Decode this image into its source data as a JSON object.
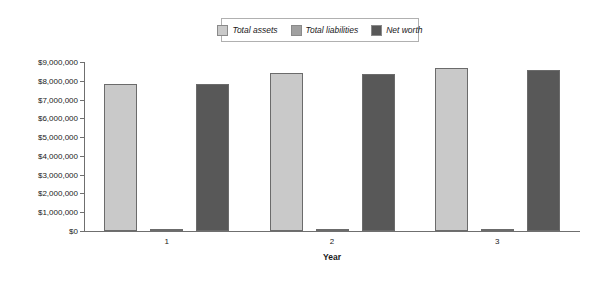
{
  "chart_data": {
    "type": "bar",
    "title": "",
    "subtitle": "",
    "xlabel": "Year",
    "ylabel": "",
    "categories": [
      "1",
      "2",
      "3"
    ],
    "series": [
      {
        "name": "Total assets",
        "color": "#c9c9c9",
        "values": [
          7850000,
          8400000,
          8700000
        ]
      },
      {
        "name": "Total liabilities",
        "color": "#a0a0a0",
        "values": [
          20000,
          30000,
          120000
        ]
      },
      {
        "name": "Net worth",
        "color": "#585858",
        "values": [
          7830000,
          8370000,
          8580000
        ]
      }
    ],
    "ylim": [
      0,
      9000000
    ],
    "ytick_values": [
      0,
      1000000,
      2000000,
      3000000,
      4000000,
      5000000,
      6000000,
      7000000,
      8000000,
      9000000
    ],
    "ytick_labels": [
      "$0",
      "$1,000,000",
      "$2,000,000",
      "$3,000,000",
      "$4,000,000",
      "$5,000,000",
      "$6,000,000",
      "$7,000,000",
      "$8,000,000",
      "$9,000,000"
    ],
    "grid": false,
    "legend_position": "top-center",
    "legend_entries": [
      "Total assets",
      "Total liabilities",
      "Net worth"
    ]
  }
}
